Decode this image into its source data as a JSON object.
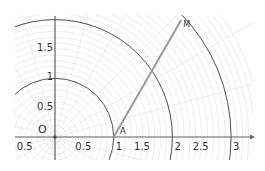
{
  "diagram": {
    "type": "polar-grid",
    "origin_label": "O",
    "x_axis": {
      "tick_labels": [
        {
          "value": -0.5,
          "text": "0.5"
        },
        {
          "value": 0.5,
          "text": "0.5"
        },
        {
          "value": 1,
          "text": "1"
        },
        {
          "value": 1.5,
          "text": "1.5"
        },
        {
          "value": 2,
          "text": "2"
        },
        {
          "value": 2.5,
          "text": "2.5"
        },
        {
          "value": 3,
          "text": "3"
        }
      ]
    },
    "y_axis": {
      "tick_labels": [
        {
          "value": 0.5,
          "text": "0.5"
        },
        {
          "value": 1,
          "text": "1"
        },
        {
          "value": 1.5,
          "text": "1.5"
        }
      ]
    },
    "circles": [
      1,
      2,
      3
    ],
    "segment": {
      "start_label": "A",
      "end_label": "M",
      "start": [
        1,
        0
      ],
      "angle_deg": 60,
      "length": 2.3
    },
    "colors": {
      "circle": "#555555",
      "axis": "#666666",
      "segment": "#9a9a9a",
      "grid": "#e4e4e4"
    }
  }
}
